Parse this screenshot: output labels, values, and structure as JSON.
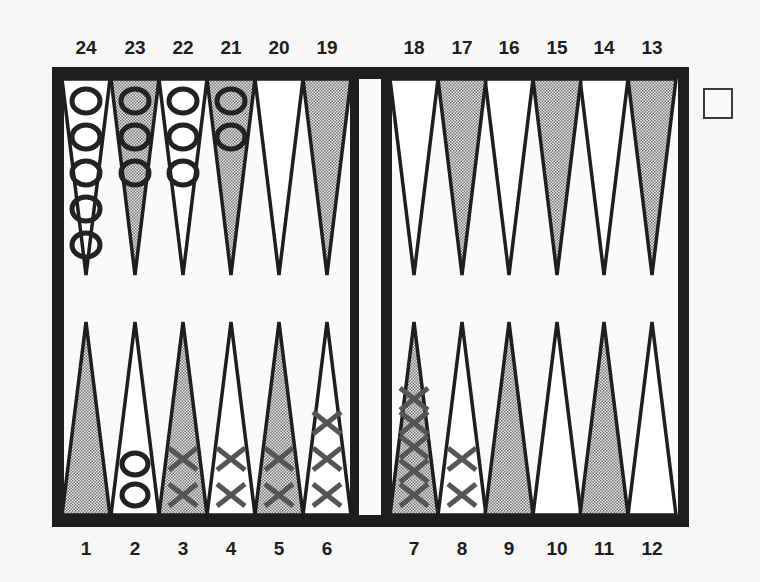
{
  "board": {
    "top_labels": [
      "24",
      "23",
      "22",
      "21",
      "20",
      "19",
      "18",
      "17",
      "16",
      "15",
      "14",
      "13"
    ],
    "bottom_labels": [
      "1",
      "2",
      "3",
      "4",
      "5",
      "6",
      "7",
      "8",
      "9",
      "10",
      "11",
      "12"
    ],
    "colors": {
      "frame": "#1e1e1e",
      "background": "#f7f7f5",
      "point_light": "#ffffff",
      "point_dark_pattern": "#9a9a9a",
      "o_checker": "#222222",
      "x_checker": "#555555"
    },
    "points": [
      {
        "number": 1,
        "shade": "dark",
        "checkers": {
          "type": "",
          "count": 0
        }
      },
      {
        "number": 2,
        "shade": "light",
        "checkers": {
          "type": "O",
          "count": 2
        }
      },
      {
        "number": 3,
        "shade": "dark",
        "checkers": {
          "type": "X",
          "count": 2
        }
      },
      {
        "number": 4,
        "shade": "light",
        "checkers": {
          "type": "X",
          "count": 2
        }
      },
      {
        "number": 5,
        "shade": "dark",
        "checkers": {
          "type": "X",
          "count": 2
        }
      },
      {
        "number": 6,
        "shade": "light",
        "checkers": {
          "type": "X",
          "count": 3
        }
      },
      {
        "number": 7,
        "shade": "dark",
        "checkers": {
          "type": "X",
          "count": 5
        }
      },
      {
        "number": 8,
        "shade": "light",
        "checkers": {
          "type": "X",
          "count": 2
        }
      },
      {
        "number": 9,
        "shade": "dark",
        "checkers": {
          "type": "",
          "count": 0
        }
      },
      {
        "number": 10,
        "shade": "light",
        "checkers": {
          "type": "",
          "count": 0
        }
      },
      {
        "number": 11,
        "shade": "dark",
        "checkers": {
          "type": "",
          "count": 0
        }
      },
      {
        "number": 12,
        "shade": "light",
        "checkers": {
          "type": "",
          "count": 0
        }
      },
      {
        "number": 13,
        "shade": "dark",
        "checkers": {
          "type": "",
          "count": 0
        }
      },
      {
        "number": 14,
        "shade": "light",
        "checkers": {
          "type": "",
          "count": 0
        }
      },
      {
        "number": 15,
        "shade": "dark",
        "checkers": {
          "type": "",
          "count": 0
        }
      },
      {
        "number": 16,
        "shade": "light",
        "checkers": {
          "type": "",
          "count": 0
        }
      },
      {
        "number": 17,
        "shade": "dark",
        "checkers": {
          "type": "",
          "count": 0
        }
      },
      {
        "number": 18,
        "shade": "light",
        "checkers": {
          "type": "",
          "count": 0
        }
      },
      {
        "number": 19,
        "shade": "dark",
        "checkers": {
          "type": "",
          "count": 0
        }
      },
      {
        "number": 20,
        "shade": "light",
        "checkers": {
          "type": "",
          "count": 0
        }
      },
      {
        "number": 21,
        "shade": "dark",
        "checkers": {
          "type": "O",
          "count": 2
        }
      },
      {
        "number": 22,
        "shade": "light",
        "checkers": {
          "type": "O",
          "count": 3
        }
      },
      {
        "number": 23,
        "shade": "dark",
        "checkers": {
          "type": "O",
          "count": 3
        }
      },
      {
        "number": 24,
        "shade": "light",
        "checkers": {
          "type": "O",
          "count": 5
        }
      }
    ],
    "doubling_cube": {
      "value": ""
    }
  }
}
